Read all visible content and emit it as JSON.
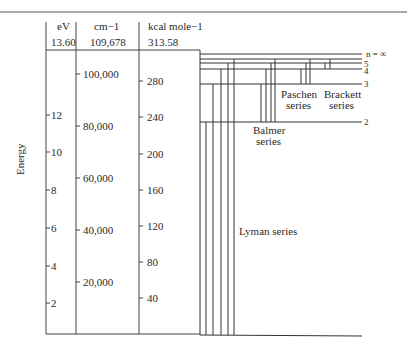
{
  "diagram": {
    "axis_label": "Energy",
    "columns": [
      {
        "unit": "eV",
        "top_value": "13.60",
        "ticks": [
          {
            "label": "12",
            "y": 115
          },
          {
            "label": "10",
            "y": 152
          },
          {
            "label": "8",
            "y": 190
          },
          {
            "label": "6",
            "y": 228
          },
          {
            "label": "4",
            "y": 266
          },
          {
            "label": "2",
            "y": 303
          }
        ]
      },
      {
        "unit": "cm−1",
        "top_value": "109,678",
        "ticks": [
          {
            "label": "100,000",
            "y": 97
          },
          {
            "label": "80,000",
            "y": 154
          },
          {
            "label": "60,000",
            "y": 201
          },
          {
            "label": "40,000",
            "y": 249
          },
          {
            "label": "20,000",
            "y": 296
          }
        ]
      },
      {
        "unit": "kcal mole−1",
        "top_value": "313.58",
        "ticks": [
          {
            "label": "280",
            "y": 109
          },
          {
            "label": "240",
            "y": 145
          },
          {
            "label": "200",
            "y": 183
          },
          {
            "label": "160",
            "y": 219
          },
          {
            "label": "120",
            "y": 256
          },
          {
            "label": "80",
            "y": 293
          },
          {
            "label": "40",
            "y": 330
          }
        ]
      }
    ],
    "levels": [
      {
        "n": "1",
        "label": "",
        "y": 335
      },
      {
        "n": "2",
        "label": "2",
        "y": 122
      },
      {
        "n": "3",
        "label": "3",
        "y": 84
      },
      {
        "n": "4",
        "label": "4",
        "y": 69
      },
      {
        "n": "5",
        "label": "5",
        "y": 63
      },
      {
        "n": "inf",
        "label": "n = ∞",
        "y": 54
      }
    ],
    "series": [
      {
        "name": "Lyman",
        "label_line1": "Lyman series",
        "label_line2": ""
      },
      {
        "name": "Balmer",
        "label_line1": "Balmer",
        "label_line2": "series"
      },
      {
        "name": "Paschen",
        "label_line1": "Paschen",
        "label_line2": "series"
      },
      {
        "name": "Brackett",
        "label_line1": "Brackett",
        "label_line2": "series"
      }
    ]
  }
}
